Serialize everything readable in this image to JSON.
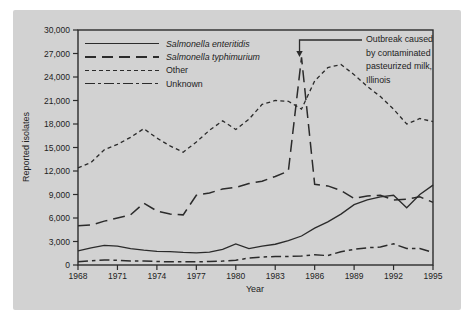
{
  "colors": {
    "line": "#2b2b2b",
    "panel_bg": "#d2d2d2",
    "page_bg": "#ffffff",
    "text": "#222222"
  },
  "chart_data": {
    "type": "line",
    "title": "",
    "xlabel": "Year",
    "ylabel": "Reported isolates",
    "xlim": [
      1968,
      1995
    ],
    "ylim": [
      0,
      30000
    ],
    "xtick_step": 3,
    "ytick_step": 3000,
    "grid": false,
    "legend_position": "top-left",
    "x": [
      1968,
      1969,
      1970,
      1971,
      1972,
      1973,
      1974,
      1975,
      1976,
      1977,
      1978,
      1979,
      1980,
      1981,
      1982,
      1983,
      1984,
      1985,
      1986,
      1987,
      1988,
      1989,
      1990,
      1991,
      1992,
      1993,
      1994,
      1995
    ],
    "series": [
      {
        "name": "Salmonella enteritidis",
        "style": "solid",
        "italic": true,
        "values": [
          1800,
          2200,
          2500,
          2400,
          2100,
          1900,
          1750,
          1700,
          1600,
          1550,
          1650,
          2000,
          2700,
          2100,
          2400,
          2650,
          3100,
          3700,
          4700,
          5500,
          6500,
          7700,
          8300,
          8700,
          8900,
          7300,
          9000,
          10200
        ]
      },
      {
        "name": "Salmonella typhimurium",
        "style": "long-dash",
        "italic": true,
        "values": [
          5000,
          5100,
          5600,
          6000,
          6400,
          7900,
          6900,
          6500,
          6400,
          8900,
          9200,
          9700,
          9900,
          10400,
          10700,
          11300,
          12000,
          26500,
          10300,
          10100,
          9500,
          8500,
          8800,
          8900,
          8300,
          8400,
          8700,
          8000
        ]
      },
      {
        "name": "Other",
        "style": "short-dash",
        "italic": false,
        "values": [
          12400,
          13100,
          14700,
          15400,
          16300,
          17400,
          16200,
          15200,
          14400,
          15700,
          17200,
          18400,
          17300,
          18600,
          20500,
          21000,
          20900,
          19900,
          23500,
          25200,
          25600,
          24300,
          22800,
          21500,
          19900,
          18000,
          18700,
          18300
        ]
      },
      {
        "name": "Unknown",
        "style": "dash-dot",
        "italic": false,
        "values": [
          400,
          550,
          650,
          600,
          500,
          500,
          450,
          400,
          400,
          400,
          450,
          500,
          600,
          900,
          1000,
          1100,
          1100,
          1150,
          1300,
          1200,
          1700,
          2000,
          2200,
          2300,
          2700,
          2100,
          2100,
          1600
        ]
      }
    ],
    "annotation": {
      "text": "Outbreak caused\nby contaminated\npasteurized milk,\nIllinois",
      "points_to": {
        "x": 1985,
        "y": 26500
      }
    }
  }
}
